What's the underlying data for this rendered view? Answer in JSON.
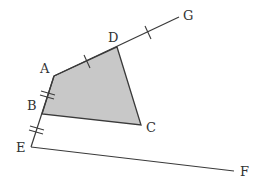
{
  "diagram": {
    "type": "geometry-figure",
    "colors": {
      "stroke": "#3a3a3a",
      "fill": "#c8c8c8",
      "label": "#333333"
    },
    "points": {
      "A": {
        "label": "A",
        "x": 54,
        "y": 76,
        "lx": 40,
        "ly": 73
      },
      "B": {
        "label": "B",
        "x": 42,
        "y": 114,
        "lx": 27,
        "ly": 110
      },
      "C": {
        "label": "C",
        "x": 141,
        "y": 125,
        "lx": 146,
        "ly": 132
      },
      "D": {
        "label": "D",
        "x": 117,
        "y": 47,
        "lx": 108,
        "ly": 42
      },
      "E": {
        "label": "E",
        "x": 31,
        "y": 147,
        "lx": 16,
        "ly": 152
      },
      "F": {
        "label": "F",
        "x": 234,
        "y": 171,
        "lx": 240,
        "ly": 176
      },
      "G": {
        "label": "G",
        "x": 179,
        "y": 17,
        "lx": 183,
        "ly": 20
      }
    },
    "shaded_polygon": [
      "A",
      "D",
      "C",
      "B"
    ],
    "segments": [
      [
        "A",
        "G"
      ],
      [
        "A",
        "E"
      ],
      [
        "E",
        "F"
      ],
      [
        "D",
        "C"
      ],
      [
        "B",
        "C"
      ]
    ],
    "equal_marks": [
      {
        "segment": [
          "A",
          "D"
        ],
        "ticks": 1
      },
      {
        "segment": [
          "D",
          "G"
        ],
        "ticks": 1
      },
      {
        "segment": [
          "A",
          "B"
        ],
        "ticks": 2
      },
      {
        "segment": [
          "B",
          "E"
        ],
        "ticks": 2
      }
    ]
  }
}
